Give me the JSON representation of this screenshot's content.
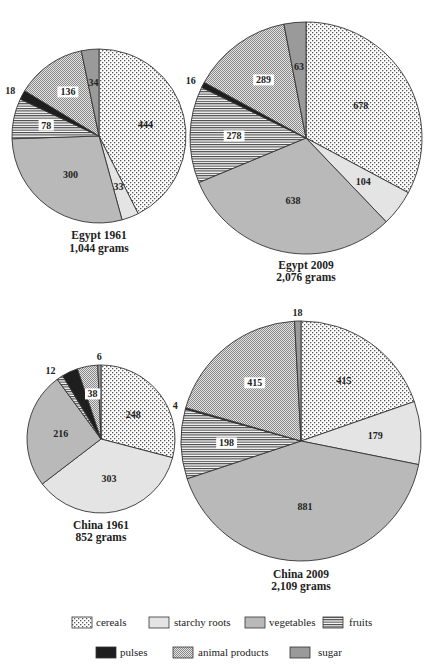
{
  "chart_data": {
    "type": "pie",
    "title": "",
    "categories": [
      "cereals",
      "starchy roots",
      "vegetables",
      "fruits",
      "pulses",
      "animal products",
      "sugar"
    ],
    "unit": "grams",
    "start": "12 o'clock, clockwise",
    "charts": [
      {
        "id": "egypt-1961",
        "title": "Egypt 1961",
        "subtitle": "1,044 grams",
        "total": 1044,
        "values": [
          444,
          33,
          300,
          78,
          18,
          136,
          34
        ]
      },
      {
        "id": "egypt-2009",
        "title": "Egypt 2009",
        "subtitle": "2,076 grams",
        "total": 2076,
        "values": [
          678,
          104,
          638,
          278,
          16,
          289,
          63
        ]
      },
      {
        "id": "china-1961",
        "title": "China 1961",
        "subtitle": "852 grams",
        "total": 852,
        "values": [
          248,
          303,
          216,
          12,
          30,
          38,
          6
        ]
      },
      {
        "id": "china-2009",
        "title": "China 2009",
        "subtitle": "2,109 grams",
        "total": 2109,
        "values": [
          415,
          179,
          881,
          198,
          4,
          415,
          18
        ]
      }
    ],
    "legend": {
      "placement": "bottom",
      "entries": [
        {
          "label": "cereals",
          "pattern": "dots"
        },
        {
          "label": "starchy roots",
          "pattern": "light-gray"
        },
        {
          "label": "vegetables",
          "pattern": "medium-gray"
        },
        {
          "label": "fruits",
          "pattern": "horizontal-stripes"
        },
        {
          "label": "pulses",
          "pattern": "black"
        },
        {
          "label": "animal products",
          "pattern": "checker"
        },
        {
          "label": "sugar",
          "pattern": "dark-gray"
        }
      ]
    }
  },
  "colors": {
    "starchy_roots": "#e4e4e4",
    "vegetables": "#b9b9b9",
    "pulses": "#1e1e1e",
    "sugar": "#9a9a9a",
    "outline": "#333333"
  }
}
